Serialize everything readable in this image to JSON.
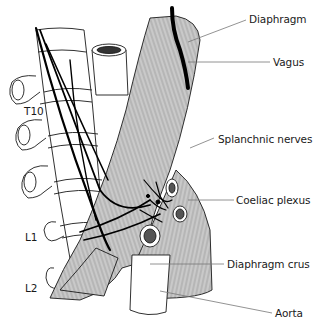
{
  "figure": {
    "type": "anatomical illustration",
    "colors": {
      "muscle_fill": "#c8c8c8",
      "outline": "#1a1a1a",
      "nerve": "#000000",
      "leader_line": "#777777",
      "background": "#ffffff"
    }
  },
  "labels": {
    "diaphragm": "Diaphragm",
    "vagus": "Vagus",
    "splanchnic_nerves": "Splanchnic nerves",
    "coeliac_plexus": "Coeliac plexus",
    "diaphragm_crus": "Diaphragm crus",
    "aorta": "Aorta"
  },
  "vertebral_levels": {
    "t10": "T10",
    "l1": "L1",
    "l2": "L2"
  }
}
